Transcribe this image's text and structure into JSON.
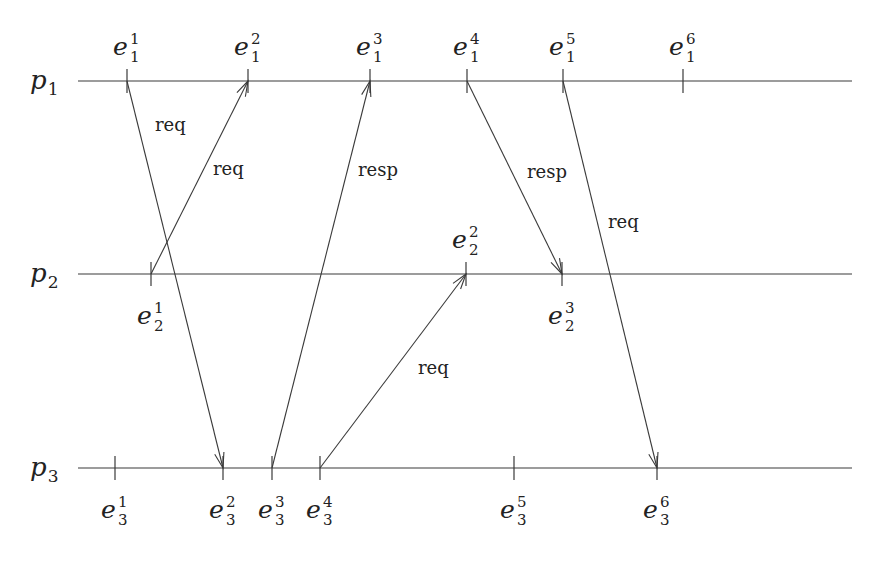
{
  "diagram": {
    "type": "space-time diagram",
    "processes": [
      {
        "id": "p1",
        "name": "p",
        "index": "1"
      },
      {
        "id": "p2",
        "name": "p",
        "index": "2"
      },
      {
        "id": "p3",
        "name": "p",
        "index": "3"
      }
    ],
    "events": [
      {
        "id": "e1_1",
        "process": "p1",
        "base": "e",
        "sub": "1",
        "sup": "1",
        "label_side": "above"
      },
      {
        "id": "e1_2",
        "process": "p1",
        "base": "e",
        "sub": "1",
        "sup": "2",
        "label_side": "above"
      },
      {
        "id": "e1_3",
        "process": "p1",
        "base": "e",
        "sub": "1",
        "sup": "3",
        "label_side": "above"
      },
      {
        "id": "e1_4",
        "process": "p1",
        "base": "e",
        "sub": "1",
        "sup": "4",
        "label_side": "above"
      },
      {
        "id": "e1_5",
        "process": "p1",
        "base": "e",
        "sub": "1",
        "sup": "5",
        "label_side": "above"
      },
      {
        "id": "e1_6",
        "process": "p1",
        "base": "e",
        "sub": "1",
        "sup": "6",
        "label_side": "above"
      },
      {
        "id": "e2_1",
        "process": "p2",
        "base": "e",
        "sub": "2",
        "sup": "1",
        "label_side": "below"
      },
      {
        "id": "e2_2",
        "process": "p2",
        "base": "e",
        "sub": "2",
        "sup": "2",
        "label_side": "above"
      },
      {
        "id": "e2_3",
        "process": "p2",
        "base": "e",
        "sub": "2",
        "sup": "3",
        "label_side": "below"
      },
      {
        "id": "e3_1",
        "process": "p3",
        "base": "e",
        "sub": "3",
        "sup": "1",
        "label_side": "below"
      },
      {
        "id": "e3_2",
        "process": "p3",
        "base": "e",
        "sub": "3",
        "sup": "2",
        "label_side": "below"
      },
      {
        "id": "e3_3",
        "process": "p3",
        "base": "e",
        "sub": "3",
        "sup": "3",
        "label_side": "below"
      },
      {
        "id": "e3_4",
        "process": "p3",
        "base": "e",
        "sub": "3",
        "sup": "4",
        "label_side": "below"
      },
      {
        "id": "e3_5",
        "process": "p3",
        "base": "e",
        "sub": "3",
        "sup": "5",
        "label_side": "below"
      },
      {
        "id": "e3_6",
        "process": "p3",
        "base": "e",
        "sub": "3",
        "sup": "6",
        "label_side": "below"
      }
    ],
    "messages": [
      {
        "id": "m1",
        "from": "e1_1",
        "to": "e3_2",
        "label": "req"
      },
      {
        "id": "m2",
        "from": "e2_1",
        "to": "e1_2",
        "label": "req"
      },
      {
        "id": "m3",
        "from": "e3_3",
        "to": "e1_3",
        "label": "resp"
      },
      {
        "id": "m4",
        "from": "e3_4",
        "to": "e2_2",
        "label": "req"
      },
      {
        "id": "m5",
        "from": "e1_4",
        "to": "e2_3",
        "label": "resp"
      },
      {
        "id": "m6",
        "from": "e1_5",
        "to": "e3_6",
        "label": "req"
      }
    ],
    "colors": {
      "ink": "#3a3a3a",
      "background": "#ffffff"
    }
  }
}
